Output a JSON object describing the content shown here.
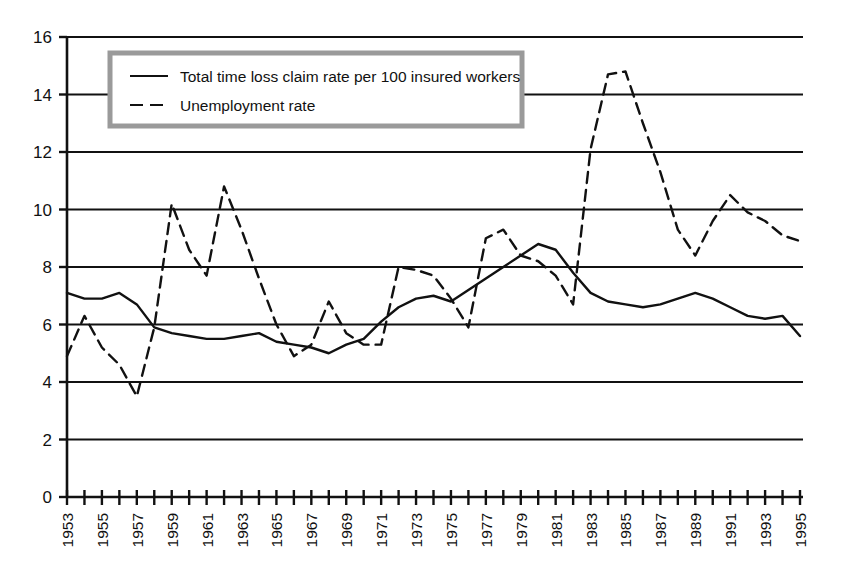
{
  "chart_data": {
    "type": "line",
    "title": "",
    "subtitle": "",
    "xlabel": "",
    "ylabel": "",
    "xlim": [
      1953,
      1995
    ],
    "ylim": [
      0,
      16
    ],
    "ytick_step": 2,
    "yticks": [
      0,
      2,
      4,
      6,
      8,
      10,
      12,
      14,
      16
    ],
    "ytick_labels": [
      "0",
      "2",
      "4",
      "6",
      "8",
      "10",
      "12",
      "14",
      "16"
    ],
    "xticks": [
      1953,
      1954,
      1955,
      1956,
      1957,
      1958,
      1959,
      1960,
      1961,
      1962,
      1963,
      1964,
      1965,
      1966,
      1967,
      1968,
      1969,
      1970,
      1971,
      1972,
      1973,
      1974,
      1975,
      1976,
      1977,
      1978,
      1979,
      1980,
      1981,
      1982,
      1983,
      1984,
      1985,
      1986,
      1987,
      1988,
      1989,
      1990,
      1991,
      1992,
      1993,
      1994,
      1995
    ],
    "xtick_labels": [
      "1953",
      "",
      "1955",
      "",
      "1957",
      "",
      "1959",
      "",
      "1961",
      "",
      "1963",
      "",
      "1965",
      "",
      "1967",
      "",
      "1969",
      "",
      "1971",
      "",
      "1973",
      "",
      "1975",
      "",
      "1977",
      "",
      "1979",
      "",
      "1981",
      "",
      "1983",
      "",
      "1985",
      "",
      "1987",
      "",
      "1989",
      "",
      "1991",
      "",
      "1993",
      "",
      "1995"
    ],
    "xtick_labels_visible": [
      "1953",
      "1955",
      "1957",
      "1959",
      "1961",
      "1963",
      "1965",
      "1967",
      "1969",
      "1971",
      "1973",
      "1975",
      "1977",
      "1979",
      "1981",
      "1983",
      "1985",
      "1987",
      "1989",
      "1991",
      "1993",
      "1995"
    ],
    "xtick_label_rotation": -90,
    "grid": "horizontal",
    "legend_position": "top-left",
    "x": [
      1953,
      1954,
      1955,
      1956,
      1957,
      1958,
      1959,
      1960,
      1961,
      1962,
      1963,
      1964,
      1965,
      1966,
      1967,
      1968,
      1969,
      1970,
      1971,
      1972,
      1973,
      1974,
      1975,
      1976,
      1977,
      1978,
      1979,
      1980,
      1981,
      1982,
      1983,
      1984,
      1985,
      1986,
      1987,
      1988,
      1989,
      1990,
      1991,
      1992,
      1993,
      1994,
      1995
    ],
    "series": [
      {
        "name": "Total time loss claim rate per 100 insured workers",
        "style": "solid",
        "color": "#111111",
        "values": [
          7.1,
          6.9,
          6.9,
          7.1,
          6.7,
          5.9,
          5.7,
          5.6,
          5.5,
          5.5,
          5.6,
          5.7,
          5.4,
          5.3,
          5.2,
          5.0,
          5.3,
          5.5,
          6.1,
          6.6,
          6.9,
          7.0,
          6.8,
          7.2,
          7.6,
          8.0,
          8.4,
          8.8,
          8.6,
          7.8,
          7.1,
          6.8,
          6.7,
          6.6,
          6.7,
          6.9,
          7.1,
          6.9,
          6.6,
          6.3,
          6.2,
          6.3,
          5.6
        ]
      },
      {
        "name": "Unemployment rate",
        "style": "dashed",
        "color": "#111111",
        "values": [
          4.9,
          6.3,
          5.2,
          4.6,
          3.5,
          5.9,
          10.2,
          8.6,
          7.7,
          10.8,
          9.3,
          7.6,
          6.0,
          4.9,
          5.3,
          6.8,
          5.7,
          5.3,
          5.3,
          8.0,
          7.9,
          7.7,
          6.9,
          5.9,
          9.0,
          9.3,
          8.4,
          8.2,
          7.7,
          6.7,
          12.1,
          14.7,
          14.8,
          13.0,
          11.3,
          9.3,
          8.4,
          9.6,
          10.5,
          9.9,
          9.6,
          9.1,
          8.9
        ]
      }
    ]
  },
  "legend": {
    "items": [
      {
        "label": "Total time loss claim rate per 100 insured workers",
        "style": "solid"
      },
      {
        "label": "Unemployment rate",
        "style": "dashed"
      }
    ],
    "border_color": "#9a9a9a",
    "background": "#ffffff"
  },
  "axes": {
    "line_color": "#111111",
    "grid_color": "#111111"
  }
}
